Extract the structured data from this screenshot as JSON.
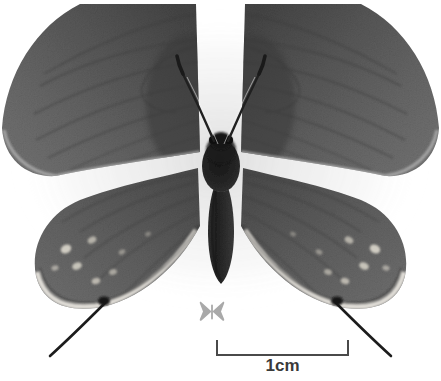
{
  "figure": {
    "kind": "natural-image",
    "family_look": "hairstreak (Lycaenidae) with hindwing tails",
    "background_color": "#ffffff",
    "rendering": "grayscale photograph",
    "caption_text": ""
  },
  "specimen": {
    "wing_color_dark": "#4f4f4f",
    "wing_color_mid": "#606060",
    "wing_color_light": "#757575",
    "body_color": "#2c2c2c",
    "vein_color": "#3d3d3d",
    "spot_color": "#d8d4c9",
    "margin_color": "#efefea",
    "antenna_color": "#242424",
    "tail_color": "#1e1e1e",
    "parts": [
      "left-forewing",
      "right-forewing",
      "left-hindwing",
      "right-hindwing",
      "thorax",
      "abdomen",
      "head",
      "left-antenna",
      "right-antenna",
      "left-hindwing-tail",
      "right-hindwing-tail"
    ]
  },
  "icon": {
    "name": "butterfly-icon",
    "color": "#a8a8a8",
    "label": ""
  },
  "scalebar": {
    "label": "1cm",
    "value": 1,
    "unit": "cm",
    "line_color": "#4a4a4a",
    "length_px": 133,
    "tick_height_px": 16
  }
}
